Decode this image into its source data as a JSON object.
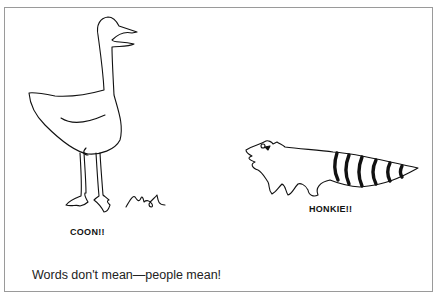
{
  "illustration": {
    "left_figure": {
      "subject": "goose",
      "label": "COON!!",
      "signature": "Mal"
    },
    "right_figure": {
      "subject": "raccoon",
      "label": "HONKIE!!"
    },
    "caption": "Words don't mean—people mean!"
  }
}
